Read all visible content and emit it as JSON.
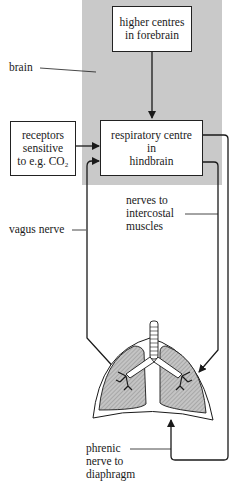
{
  "diagram": {
    "title": "",
    "colors": {
      "brain_region": "#c9c9c9",
      "lung_fill": "#b8b8b8",
      "line": "#1a1a1a"
    },
    "boxes": {
      "higher_centres": "higher centres\nin forebrain",
      "respiratory_centre": "respiratory centre\nin\nhindbrain",
      "receptors": "receptors\nsensitive\nto e.g. CO₂"
    },
    "labels": {
      "brain": "brain",
      "vagus_nerve": "vagus nerve",
      "intercostal": "nerves to\nintercostal\nmuscles",
      "phrenic": "phrenic\nnerve to\ndiaphragm"
    },
    "organs": {
      "lungs": "lungs-icon"
    }
  }
}
